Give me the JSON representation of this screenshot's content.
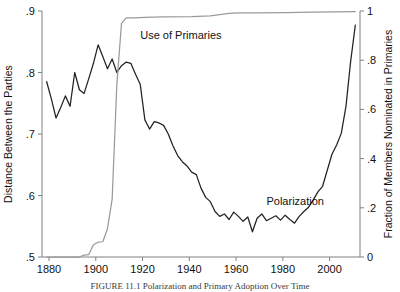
{
  "chart_data": {
    "type": "line",
    "title": "",
    "caption": "FIGURE 11.1  Polarization and Primary Adoption Over Time",
    "xlabel": "",
    "xlim": [
      1877,
      2013
    ],
    "xticks": [
      1880,
      1900,
      1920,
      1940,
      1960,
      1980,
      2000
    ],
    "xticklabels": [
      "1880",
      "1900",
      "1920",
      "1940",
      "1960",
      "1980",
      "2000"
    ],
    "grid": false,
    "legend_position": "inline-annotations",
    "axes": [
      {
        "id": "left",
        "ylabel": "Distance Between the Parties",
        "ylim": [
          0.5,
          0.9
        ],
        "yticks": [
          0.5,
          0.6,
          0.7,
          0.8,
          0.9
        ],
        "yticklabels": [
          ".5",
          ".6",
          ".7",
          ".8",
          ".9"
        ]
      },
      {
        "id": "right",
        "ylabel": "Fraction of Members Nominated in Primaries",
        "ylim": [
          0,
          1
        ],
        "yticks": [
          0,
          0.2,
          0.4,
          0.6,
          0.8,
          1
        ],
        "yticklabels": [
          "0",
          ".2",
          ".4",
          ".6",
          ".8",
          "1"
        ]
      }
    ],
    "series": [
      {
        "name": "Polarization",
        "axis": "left",
        "color": "#222222",
        "annotation": "Polarization",
        "annotation_x": 1973,
        "annotation_y": 0.585,
        "x": [
          1879,
          1881,
          1883,
          1885,
          1887,
          1889,
          1891,
          1893,
          1895,
          1897,
          1899,
          1901,
          1903,
          1905,
          1907,
          1909,
          1911,
          1913,
          1915,
          1917,
          1919,
          1921,
          1923,
          1925,
          1927,
          1929,
          1931,
          1933,
          1935,
          1937,
          1939,
          1941,
          1943,
          1945,
          1947,
          1949,
          1951,
          1953,
          1955,
          1957,
          1959,
          1961,
          1963,
          1965,
          1967,
          1969,
          1971,
          1973,
          1975,
          1977,
          1979,
          1981,
          1983,
          1985,
          1987,
          1989,
          1991,
          1993,
          1995,
          1997,
          1999,
          2001,
          2003,
          2005,
          2007,
          2009,
          2011
        ],
        "y": [
          0.785,
          0.757,
          0.726,
          0.743,
          0.762,
          0.745,
          0.8,
          0.772,
          0.766,
          0.79,
          0.815,
          0.845,
          0.826,
          0.806,
          0.822,
          0.8,
          0.811,
          0.817,
          0.815,
          0.797,
          0.781,
          0.723,
          0.708,
          0.72,
          0.718,
          0.714,
          0.7,
          0.681,
          0.665,
          0.655,
          0.648,
          0.638,
          0.634,
          0.612,
          0.597,
          0.59,
          0.574,
          0.566,
          0.57,
          0.561,
          0.573,
          0.566,
          0.558,
          0.565,
          0.541,
          0.563,
          0.57,
          0.559,
          0.563,
          0.567,
          0.56,
          0.568,
          0.561,
          0.555,
          0.566,
          0.574,
          0.581,
          0.593,
          0.606,
          0.615,
          0.641,
          0.667,
          0.682,
          0.701,
          0.745,
          0.818,
          0.877
        ]
      },
      {
        "name": "Use of Primaries",
        "axis": "right",
        "color": "#9a9a9a",
        "annotation": "Use of Primaries",
        "annotation_x": 1919,
        "annotation_y": 0.885,
        "x": [
          1879,
          1883,
          1887,
          1891,
          1893,
          1895,
          1897,
          1899,
          1901,
          1903,
          1905,
          1907,
          1909,
          1911,
          1913,
          1917,
          1921,
          1929,
          1941,
          1949,
          1957,
          1961,
          1969,
          1981,
          1993,
          2011
        ],
        "y": [
          0.0,
          0.0,
          0.0,
          0.0,
          0.0,
          0.008,
          0.01,
          0.05,
          0.06,
          0.062,
          0.115,
          0.235,
          0.7,
          0.95,
          0.972,
          0.972,
          0.974,
          0.976,
          0.977,
          0.98,
          0.99,
          0.992,
          0.992,
          0.993,
          0.995,
          0.997
        ]
      }
    ]
  }
}
